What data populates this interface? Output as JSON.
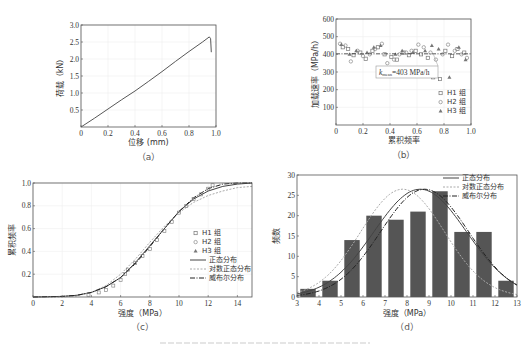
{
  "chart_data": [
    {
      "id": "a",
      "type": "line",
      "caption": "（a）",
      "xlabel": "位移 (mm)",
      "ylabel": "荷载（kN）",
      "xlim": [
        0,
        1.0
      ],
      "ylim": [
        0,
        3.0
      ],
      "xticks": [
        "0",
        "0.2",
        "0.4",
        "0.6",
        "0.8",
        "1.0"
      ],
      "yticks": [
        "0.5",
        "1.0",
        "1.5",
        "2.0",
        "2.5",
        "3.0"
      ],
      "grid": true,
      "series": [
        {
          "name": "load-displacement",
          "x": [
            0,
            0.1,
            0.2,
            0.3,
            0.4,
            0.5,
            0.6,
            0.7,
            0.8,
            0.9,
            0.95,
            0.96,
            0.965
          ],
          "y": [
            0,
            0.26,
            0.53,
            0.8,
            1.06,
            1.34,
            1.63,
            1.93,
            2.22,
            2.5,
            2.65,
            2.6,
            2.2
          ]
        }
      ]
    },
    {
      "id": "b",
      "type": "scatter",
      "caption": "（b）",
      "xlabel": "累积频率",
      "ylabel": "加载速率（MPa/h）",
      "xlim": [
        0,
        1.0
      ],
      "ylim": [
        0,
        600
      ],
      "xticks": [
        "0",
        "0.2",
        "0.4",
        "0.6",
        "0.8",
        "1.0"
      ],
      "yticks": [
        "100",
        "200",
        "300",
        "400",
        "500",
        "600"
      ],
      "grid": true,
      "annotation": "k_mean=403 MPa/h",
      "annotation_main": "k",
      "annotation_sub": "mean",
      "annotation_rest": "=403 MPa/h",
      "mean_line": 403,
      "legend": [
        "H1 组",
        "H2 组",
        "H3 组"
      ],
      "series": [
        {
          "name": "H1 组",
          "marker": "square",
          "x": [
            0.05,
            0.09,
            0.13,
            0.18,
            0.22,
            0.27,
            0.31,
            0.36,
            0.41,
            0.45,
            0.5,
            0.54,
            0.59,
            0.63,
            0.68,
            0.72,
            0.77,
            0.81,
            0.86,
            0.9,
            0.95
          ],
          "y": [
            440,
            430,
            395,
            410,
            375,
            420,
            440,
            400,
            385,
            370,
            410,
            395,
            420,
            400,
            380,
            270,
            260,
            420,
            390,
            430,
            410
          ]
        },
        {
          "name": "H2 组",
          "marker": "circle",
          "x": [
            0.03,
            0.07,
            0.11,
            0.16,
            0.2,
            0.25,
            0.29,
            0.34,
            0.38,
            0.43,
            0.47,
            0.52,
            0.56,
            0.61,
            0.65,
            0.7,
            0.74,
            0.79,
            0.83,
            0.88,
            0.93,
            0.97
          ],
          "y": [
            460,
            450,
            360,
            420,
            390,
            400,
            430,
            460,
            350,
            370,
            400,
            410,
            420,
            455,
            440,
            410,
            370,
            400,
            455,
            420,
            400,
            380
          ]
        },
        {
          "name": "H3 组",
          "marker": "triangle",
          "x": [
            0.04,
            0.1,
            0.15,
            0.23,
            0.28,
            0.33,
            0.39,
            0.44,
            0.49,
            0.57,
            0.6,
            0.66,
            0.71,
            0.76,
            0.84,
            0.91,
            0.96
          ],
          "y": [
            455,
            400,
            420,
            410,
            440,
            450,
            315,
            400,
            420,
            410,
            305,
            420,
            450,
            430,
            270,
            440,
            370
          ]
        }
      ]
    },
    {
      "id": "c",
      "type": "line",
      "caption": "（c）",
      "xlabel": "强度（MPa）",
      "ylabel": "累积频率",
      "xlim": [
        0,
        15
      ],
      "ylim": [
        0,
        1.0
      ],
      "xticks": [
        "0",
        "2",
        "4",
        "6",
        "8",
        "10",
        "12",
        "14"
      ],
      "yticks": [
        "0.2",
        "0.4",
        "0.6",
        "0.8",
        "1.0"
      ],
      "grid": true,
      "legend": [
        "H1 组",
        "H2 组",
        "H3 组",
        "正态分布",
        "对数正态分布",
        "威布尔分布"
      ],
      "series": [
        {
          "name": "正态分布",
          "style": "solid",
          "x": [
            0,
            2,
            3,
            4,
            5,
            6,
            7,
            8,
            9,
            10,
            11,
            12,
            13,
            14,
            15
          ],
          "y": [
            0,
            0.005,
            0.015,
            0.04,
            0.09,
            0.17,
            0.3,
            0.45,
            0.6,
            0.75,
            0.86,
            0.93,
            0.97,
            0.99,
            1.0
          ]
        },
        {
          "name": "对数正态分布",
          "style": "dotted",
          "x": [
            0,
            2,
            3,
            4,
            5,
            6,
            7,
            8,
            9,
            10,
            11,
            12,
            13,
            14,
            15
          ],
          "y": [
            0,
            0.001,
            0.01,
            0.04,
            0.1,
            0.2,
            0.33,
            0.48,
            0.62,
            0.74,
            0.83,
            0.89,
            0.93,
            0.96,
            0.97
          ]
        },
        {
          "name": "威布尔分布",
          "style": "dashdot",
          "x": [
            0,
            2,
            3,
            4,
            5,
            6,
            7,
            8,
            9,
            10,
            11,
            12,
            13,
            14,
            15
          ],
          "y": [
            0,
            0.005,
            0.015,
            0.04,
            0.09,
            0.17,
            0.29,
            0.44,
            0.6,
            0.75,
            0.87,
            0.95,
            0.99,
            1.0,
            1.0
          ]
        },
        {
          "name": "empirical",
          "style": "markers",
          "x": [
            3.8,
            4.5,
            5.0,
            5.5,
            6.0,
            6.3,
            6.5,
            7.0,
            7.5,
            8.0,
            8.5,
            9.0,
            9.5,
            10.0,
            10.5,
            11.0,
            11.5,
            12.0,
            12.3
          ],
          "y": [
            0.02,
            0.04,
            0.06,
            0.1,
            0.15,
            0.2,
            0.24,
            0.3,
            0.36,
            0.42,
            0.5,
            0.58,
            0.66,
            0.74,
            0.8,
            0.86,
            0.9,
            0.95,
            0.98
          ]
        }
      ]
    },
    {
      "id": "d",
      "type": "bar",
      "caption": "（d）",
      "xlabel": "强度（MPa）",
      "ylabel": "频数",
      "xlim": [
        3,
        13
      ],
      "ylim": [
        0,
        30
      ],
      "xticks": [
        "3",
        "4",
        "5",
        "6",
        "7",
        "8",
        "9",
        "10",
        "11",
        "12",
        "13"
      ],
      "yticks": [
        "0",
        "5",
        "10",
        "15",
        "20",
        "25",
        "30"
      ],
      "legend": [
        "正态分布",
        "对数正态分布",
        "威布尔分布"
      ],
      "categories": [
        "3-4",
        "4-5",
        "5-6",
        "6-7",
        "7-8",
        "8-9",
        "9-10",
        "10-11",
        "11-12",
        "12-13"
      ],
      "values": [
        2,
        4,
        14,
        20,
        19,
        21,
        26,
        16,
        16,
        4
      ],
      "series": [
        {
          "name": "正态分布",
          "style": "solid",
          "peak_x": 8.6,
          "peak_y": 26.5,
          "sigma": 2.1
        },
        {
          "name": "对数正态分布",
          "style": "dotted",
          "peak_x": 7.8,
          "peak_y": 26.5,
          "sigma": 1.9
        },
        {
          "name": "威布尔分布",
          "style": "dashdot",
          "peak_x": 8.8,
          "peak_y": 26.5,
          "sigma": 2.0
        }
      ]
    }
  ]
}
